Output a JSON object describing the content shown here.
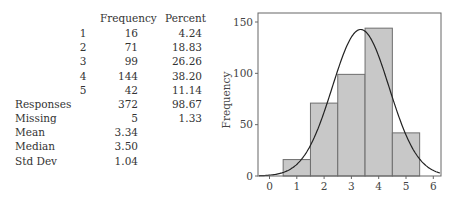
{
  "table": {
    "headers": {
      "frequency": "Frequency",
      "percent": "Percent"
    },
    "categories": [
      {
        "label": "1",
        "frequency": "16",
        "percent": "4.24"
      },
      {
        "label": "2",
        "frequency": "71",
        "percent": "18.83"
      },
      {
        "label": "3",
        "frequency": "99",
        "percent": "26.26"
      },
      {
        "label": "4",
        "frequency": "144",
        "percent": "38.20"
      },
      {
        "label": "5",
        "frequency": "42",
        "percent": "11.14"
      }
    ],
    "summary": [
      {
        "label": "Responses",
        "frequency": "372",
        "percent": "98.67"
      },
      {
        "label": "Missing",
        "frequency": "5",
        "percent": "1.33"
      },
      {
        "label": "Mean",
        "frequency": "3.34",
        "percent": ""
      },
      {
        "label": "Median",
        "frequency": "3.50",
        "percent": ""
      },
      {
        "label": "Std Dev",
        "frequency": "1.04",
        "percent": ""
      }
    ]
  },
  "chart_data": {
    "type": "bar",
    "subtype": "histogram-with-normal-curve",
    "title": "",
    "xlabel": "",
    "ylabel": "Frequency",
    "categories": [
      "1",
      "2",
      "3",
      "4",
      "5"
    ],
    "values": [
      16,
      71,
      99,
      144,
      42
    ],
    "bin_width": 1,
    "x_ticks": [
      "0",
      "1",
      "2",
      "3",
      "4",
      "5",
      "6"
    ],
    "y_ticks": [
      "0",
      "50",
      "100",
      "150"
    ],
    "xlim": [
      -0.4,
      6.3
    ],
    "ylim": [
      0,
      159
    ],
    "grid": false,
    "legend": null,
    "overlay": {
      "type": "normal-curve",
      "mean": 3.34,
      "sd": 1.04,
      "n": 372
    },
    "colors": {
      "bar_fill": "#c8c8c8",
      "bar_edge": "#6e6e6e",
      "curve": "#222222",
      "axis": "#666666"
    }
  }
}
